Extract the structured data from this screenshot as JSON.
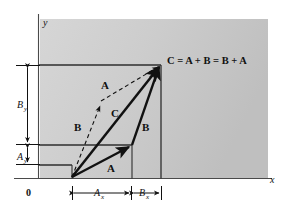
{
  "figure": {
    "kind": "vector-addition-parallelogram-diagram",
    "background_panel_color": "#c9c9c9",
    "line_color": "#111111",
    "axes": {
      "y_label": "y",
      "x_label": "x",
      "origin_label": "0"
    },
    "equation": "C = A + B = B + A",
    "vectors": [
      {
        "id": "a-lower",
        "label": "A",
        "style": "solid"
      },
      {
        "id": "b-right",
        "label": "B",
        "style": "solid"
      },
      {
        "id": "c-diagonal",
        "label": "C",
        "style": "solid"
      },
      {
        "id": "b-dashed",
        "label": "B",
        "style": "dashed"
      },
      {
        "id": "a-dashed",
        "label": "A",
        "style": "dashed"
      }
    ],
    "dimensions": [
      {
        "id": "a-x",
        "base": "A",
        "sub": "x",
        "orientation": "horizontal"
      },
      {
        "id": "b-x",
        "base": "B",
        "sub": "x",
        "orientation": "horizontal"
      },
      {
        "id": "a-y",
        "base": "A",
        "sub": "y",
        "orientation": "vertical"
      },
      {
        "id": "b-y",
        "base": "B",
        "sub": "y",
        "orientation": "vertical"
      }
    ]
  }
}
